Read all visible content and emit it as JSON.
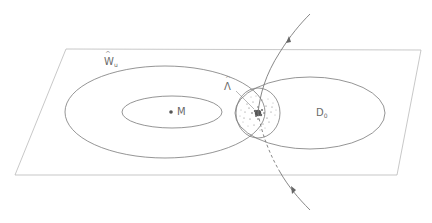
{
  "figure": {
    "labels": {
      "w_u": {
        "main": "W",
        "sub": "u",
        "accent": "hat"
      },
      "lambda": {
        "main": "Λ",
        "accent": "hat"
      },
      "m": {
        "main": "M"
      },
      "d0": {
        "main": "D",
        "sub": "0"
      }
    },
    "colors": {
      "line": "#7a7a7a",
      "plane": "#a8a8a8",
      "text": "#6a6a6a",
      "dots": "#555555"
    },
    "plane": {
      "corners": [
        [
          66,
          49
        ],
        [
          421,
          50
        ],
        [
          397,
          175
        ],
        [
          15,
          175
        ]
      ]
    },
    "ellipses": [
      {
        "name": "outer-w-ellipse",
        "cx": 165,
        "cy": 112,
        "rx": 100,
        "ry": 46
      },
      {
        "name": "inner-m-ellipse",
        "cx": 172,
        "cy": 112,
        "rx": 50,
        "ry": 16
      },
      {
        "name": "d0-ellipse",
        "cx": 310,
        "cy": 113,
        "rx": 75,
        "ry": 36
      },
      {
        "name": "lambda-neighborhood",
        "cx": 258,
        "cy": 113,
        "rx": 22,
        "ry": 25
      }
    ],
    "point_m": [
      171,
      112
    ]
  }
}
